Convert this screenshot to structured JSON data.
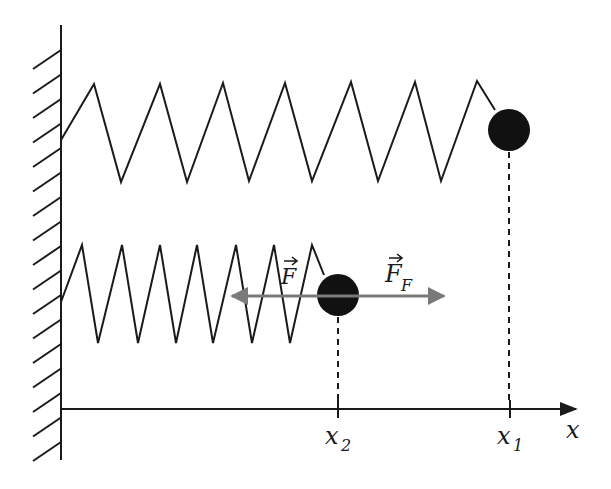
{
  "diagram": {
    "colors": {
      "ink": "#1a1a1a",
      "force_arrow": "#7a7a7a",
      "mass": "#111111",
      "background": "#ffffff"
    },
    "wall": {
      "x": 61,
      "y_top": 25,
      "y_bottom": 460,
      "hatch_count": 17
    },
    "axis": {
      "label": "x",
      "y": 409,
      "x_start": 61,
      "x_end": 578
    },
    "springs": [
      {
        "name": "top-spring",
        "state": "stretched",
        "mass_position_label": "x₁",
        "mass_center": [
          509,
          130
        ],
        "mass_radius": 21,
        "points": [
          [
            61,
            140
          ],
          [
            94,
            84
          ],
          [
            121,
            182
          ],
          [
            160,
            84
          ],
          [
            187,
            182
          ],
          [
            223,
            83
          ],
          [
            249,
            181
          ],
          [
            285,
            83
          ],
          [
            312,
            181
          ],
          [
            351,
            82
          ],
          [
            378,
            181
          ],
          [
            415,
            82
          ],
          [
            441,
            181
          ],
          [
            477,
            81
          ],
          [
            495,
            110
          ]
        ]
      },
      {
        "name": "bottom-spring",
        "state": "compressed",
        "mass_position_label": "x₂",
        "mass_center": [
          338,
          295
        ],
        "mass_radius": 21,
        "points": [
          [
            61,
            302
          ],
          [
            82,
            245
          ],
          [
            98,
            343
          ],
          [
            122,
            245
          ],
          [
            138,
            343
          ],
          [
            160,
            245
          ],
          [
            176,
            343
          ],
          [
            197,
            245
          ],
          [
            213,
            343
          ],
          [
            236,
            245
          ],
          [
            252,
            343
          ],
          [
            274,
            245
          ],
          [
            290,
            343
          ],
          [
            312,
            245
          ],
          [
            324,
            275
          ]
        ]
      }
    ],
    "forces": {
      "spring_force": {
        "label": "F",
        "subscript": "",
        "direction": "left"
      },
      "external_force": {
        "label": "F",
        "subscript": "F",
        "direction": "right"
      },
      "arrow": {
        "x_left": 229,
        "x_right": 448,
        "y": 297
      }
    },
    "tick_labels": {
      "x1": {
        "text": "x",
        "subscript": "1",
        "x": 510
      },
      "x2": {
        "text": "x",
        "subscript": "2",
        "x": 338
      }
    }
  }
}
